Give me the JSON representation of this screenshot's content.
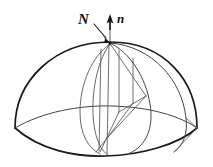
{
  "figure": {
    "background_color": "#ffffff",
    "width": 213,
    "height": 167,
    "outline_color": "#1a1a1a",
    "curve_color": "#555555",
    "label_color": "#111111"
  },
  "labels": {
    "surface_normal": "N",
    "unit_normal": "n"
  },
  "geometry": {
    "apex": {
      "x": 110,
      "y": 42
    },
    "left_vertex": {
      "x": 15,
      "y": 128
    },
    "right_vertex": {
      "x": 197,
      "y": 128
    },
    "base_bottom": {
      "x": 106,
      "y": 155
    },
    "dome_peak_y": 42,
    "nadir_point": {
      "x": 95,
      "y": 152
    },
    "kite_right_vertex": {
      "x": 146,
      "y": 96
    }
  },
  "vectors": [
    {
      "name": "N",
      "kind": "surface-normal",
      "label": "N",
      "label_x": 90,
      "label_y": 20,
      "tail": {
        "x": 96,
        "y": 24
      },
      "tip": {
        "x": 109,
        "y": 41
      },
      "style": "leader-with-arrow"
    },
    {
      "name": "n",
      "kind": "unit-normal",
      "label": "n",
      "label_x": 118,
      "label_y": 20,
      "tail": {
        "x": 110,
        "y": 46
      },
      "tip": {
        "x": 110,
        "y": 16
      },
      "style": "vertical-arrow"
    }
  ],
  "elements": {
    "dome_outline": "hemisphere-boundary",
    "base_curve": "curved-base-edge",
    "equator_arc": "horizontal-great-circle",
    "meridian_arcs": "vertical-great-circles",
    "inner_polygon": "kite-quadrilateral"
  }
}
